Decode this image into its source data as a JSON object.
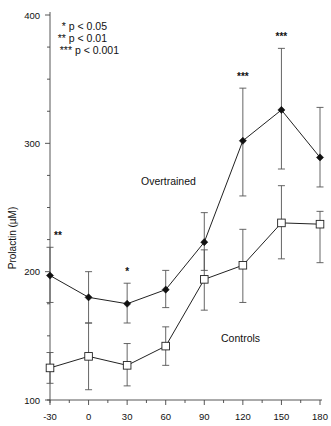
{
  "chart_data": {
    "type": "line",
    "title": "",
    "xlabel": "",
    "ylabel": "Prolactin (µM)",
    "x": [
      -30,
      0,
      30,
      60,
      90,
      120,
      150,
      180
    ],
    "xticks": [
      "-30",
      "0",
      "30",
      "60",
      "90",
      "120",
      "150",
      "180"
    ],
    "yticks": [
      "100",
      "200",
      "300",
      "400"
    ],
    "ylim": [
      100,
      400
    ],
    "xlim": [
      -30,
      180
    ],
    "grid": false,
    "series": [
      {
        "name": "Overtrained",
        "marker": "filled-diamond",
        "values": [
          197,
          180,
          175,
          186,
          223,
          302,
          326,
          289
        ],
        "error_upper": [
          219,
          200,
          191,
          201,
          246,
          343,
          374,
          328
        ],
        "error_lower": [
          176,
          160,
          160,
          172,
          201,
          259,
          280,
          266
        ]
      },
      {
        "name": "Controls",
        "marker": "open-square",
        "values": [
          125,
          134,
          127,
          142,
          194,
          205,
          238,
          237
        ],
        "error_upper": [
          137,
          160,
          144,
          157,
          217,
          233,
          267,
          247
        ],
        "error_lower": [
          113,
          108,
          111,
          127,
          170,
          176,
          210,
          207
        ]
      }
    ],
    "significance": [
      {
        "x": -30,
        "label": "**"
      },
      {
        "x": 30,
        "label": "*"
      },
      {
        "x": 120,
        "label": "***"
      },
      {
        "x": 150,
        "label": "***"
      }
    ],
    "legend": [
      "* p < 0.05",
      "** p < 0.01",
      "*** p < 0.001"
    ],
    "legend_position": "upper-left",
    "annotations": [
      "Overtrained",
      "Controls"
    ]
  },
  "labels": {
    "ylabel": "Prolactin (µM)",
    "overtrained": "Overtrained",
    "controls": "Controls",
    "legend": [
      "* p < 0.05",
      "** p < 0.01",
      "*** p < 0.001"
    ]
  }
}
